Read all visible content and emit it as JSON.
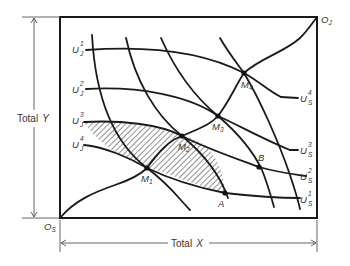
{
  "diagram": {
    "origins": {
      "s": {
        "base": "O",
        "sub": "S"
      },
      "j": {
        "base": "O",
        "sub": "J"
      }
    },
    "dimensions": {
      "x_label": "Total",
      "x_var": "X",
      "y_label": "Total",
      "y_var": "Y"
    },
    "indifference_j": [
      {
        "base": "U",
        "sup": "1",
        "sub": "J"
      },
      {
        "base": "U",
        "sup": "2",
        "sub": "J"
      },
      {
        "base": "U",
        "sup": "3",
        "sub": "J"
      },
      {
        "base": "U",
        "sup": "4",
        "sub": "J"
      }
    ],
    "indifference_s": [
      {
        "base": "U",
        "sup": "4",
        "sub": "S"
      },
      {
        "base": "U",
        "sup": "3",
        "sub": "S"
      },
      {
        "base": "U",
        "sup": "2",
        "sub": "S"
      },
      {
        "base": "U",
        "sup": "1",
        "sub": "S"
      }
    ],
    "points": [
      {
        "base": "M",
        "sub": "1"
      },
      {
        "base": "M",
        "sub": "2"
      },
      {
        "base": "M",
        "sub": "3"
      },
      {
        "base": "M",
        "sub": "4"
      },
      {
        "label": "A"
      },
      {
        "label": "B"
      }
    ],
    "shaded_region": "lens between U_J^3 and U_S^1 through A"
  }
}
